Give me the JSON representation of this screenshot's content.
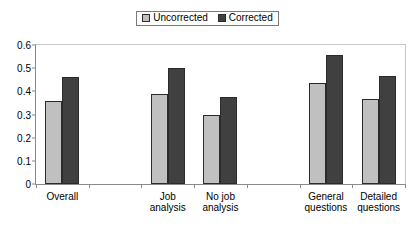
{
  "legend": {
    "entries": [
      {
        "label": "Uncorrected",
        "color": "#c0c0c0",
        "swatch_name": "legend-swatch-uncorrected"
      },
      {
        "label": "Corrected",
        "color": "#404040",
        "swatch_name": "legend-swatch-corrected"
      }
    ]
  },
  "chart_data": {
    "type": "bar",
    "title": "",
    "subtitle": "",
    "xlabel": "",
    "ylabel": "",
    "ylim": [
      0,
      0.6
    ],
    "yticks": [
      "0",
      "0.1",
      "0.2",
      "0.3",
      "0.4",
      "0.5",
      "0.6"
    ],
    "ytick_values": [
      0,
      0.1,
      0.2,
      0.3,
      0.4,
      0.5,
      0.6
    ],
    "grid": false,
    "legend_position": "top-center",
    "categories": [
      "Overall",
      "",
      "Job\nanalysis",
      "No job\nanalysis",
      "",
      "General\nquestions",
      "Detailed\nquestions"
    ],
    "category_labels": [
      "Overall",
      "",
      "Job analysis",
      "No job analysis",
      "",
      "General questions",
      "Detailed questions"
    ],
    "series": [
      {
        "name": "Uncorrected",
        "color": "#c0c0c0",
        "values": [
          0.36,
          null,
          0.39,
          0.3,
          null,
          0.435,
          0.365
        ]
      },
      {
        "name": "Corrected",
        "color": "#404040",
        "values": [
          0.46,
          null,
          0.5,
          0.375,
          null,
          0.555,
          0.465
        ]
      }
    ]
  }
}
